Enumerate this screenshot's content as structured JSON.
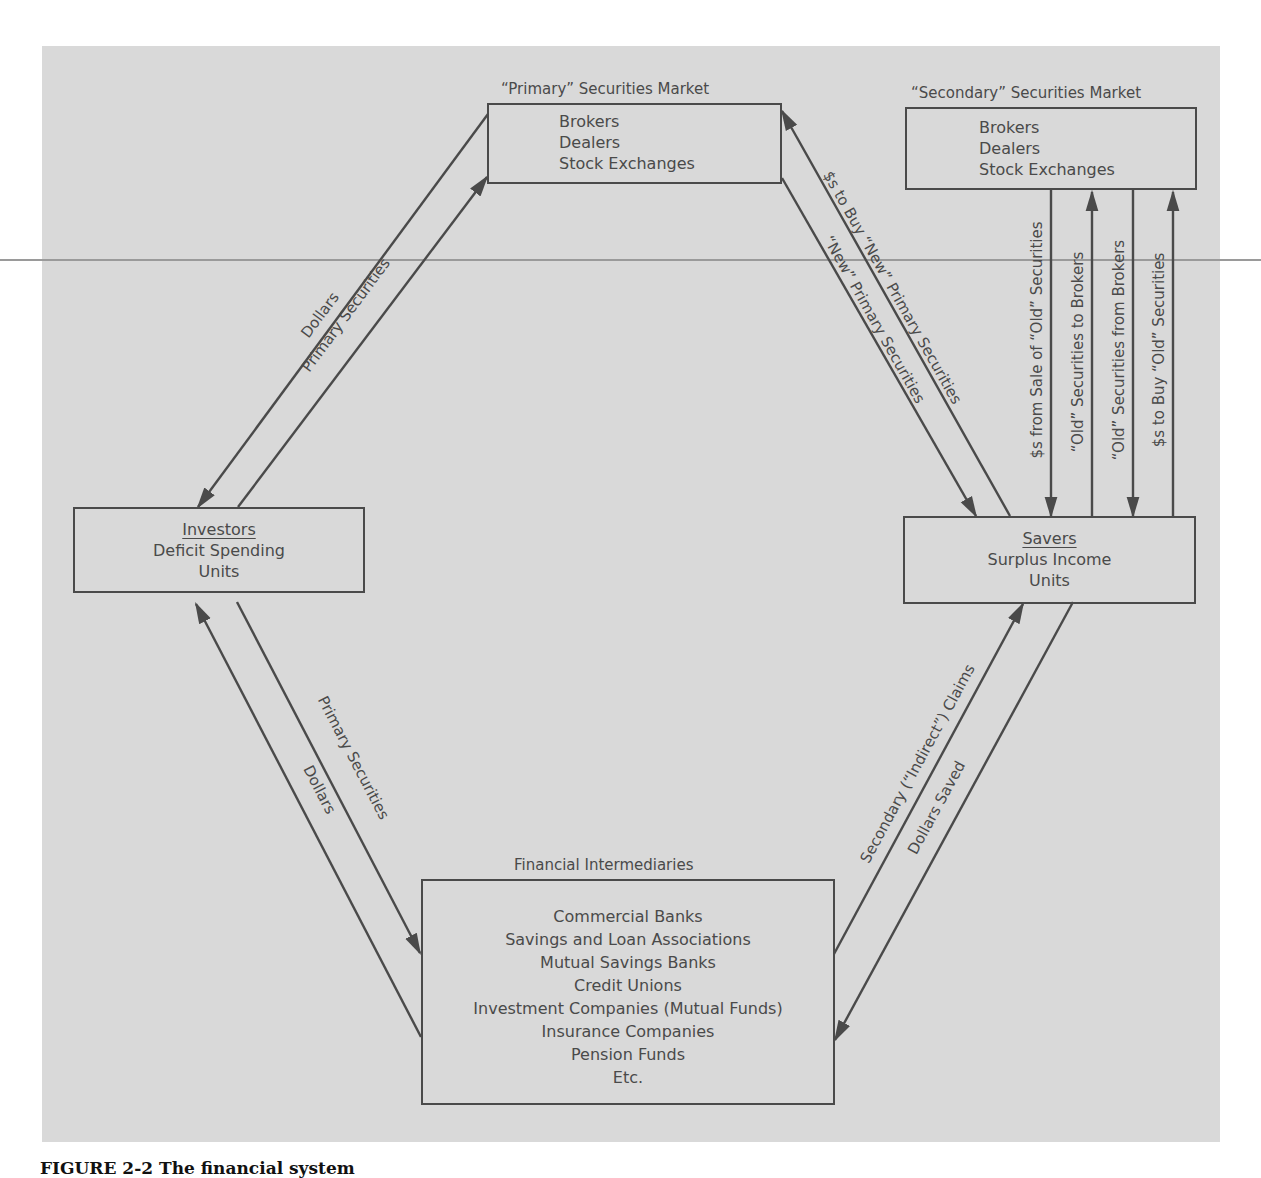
{
  "figure": {
    "caption": "FIGURE 2-2  The financial system",
    "colors": {
      "panel_background": "#d9d9d9",
      "line": "#4a4a4a",
      "page_background": "#ffffff"
    }
  },
  "nodes": {
    "primary_market": {
      "title": "“Primary” Securities Market",
      "lines": [
        "Brokers",
        "Dealers",
        "Stock Exchanges"
      ]
    },
    "secondary_market": {
      "title": "“Secondary” Securities Market",
      "lines": [
        "Brokers",
        "Dealers",
        "Stock Exchanges"
      ]
    },
    "investors": {
      "heading": "Investors",
      "lines": [
        "Deficit Spending",
        "Units"
      ]
    },
    "savers": {
      "heading": "Savers",
      "lines": [
        "Surplus Income",
        "Units"
      ]
    },
    "intermediaries": {
      "title": "Financial Intermediaries",
      "lines": [
        "Commercial Banks",
        "Savings and Loan Associations",
        "Mutual Savings Banks",
        "Credit Unions",
        "Investment Companies (Mutual Funds)",
        "Insurance Companies",
        "Pension Funds",
        "Etc."
      ]
    }
  },
  "flows": {
    "investors_primary": {
      "dollars": "Dollars",
      "securities": "Primary Securities"
    },
    "savers_primary": {
      "dollars": "$s to Buy “New” Primary Securities",
      "securities": "“New” Primary Securities"
    },
    "savers_secondary": [
      "$s from Sale of “Old” Securities",
      "“Old” Securities to Brokers",
      "“Old” Securities from Brokers",
      "$s to Buy “Old” Securities"
    ],
    "investors_intermediaries": {
      "securities": "Primary Securities",
      "dollars": "Dollars"
    },
    "savers_intermediaries": {
      "claims": "Secondary (“Indirect”) Claims",
      "dollars": "Dollars Saved"
    }
  }
}
